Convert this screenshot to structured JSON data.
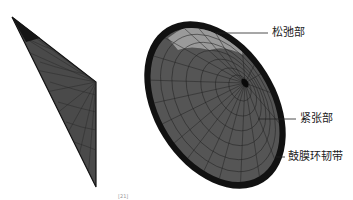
{
  "figure": {
    "left_view": {
      "description": "side view of tympanic membrane mesh"
    },
    "right_view": {
      "description": "oblique view of tympanic membrane mesh"
    },
    "labels": [
      {
        "id": "pars-flaccida",
        "text": "松弛部"
      },
      {
        "id": "pars-tensa",
        "text": "紧张部"
      },
      {
        "id": "annular-ligament",
        "text": "鼓膜环韧带"
      }
    ],
    "citation": "[21]"
  },
  "colors": {
    "mesh_dark": "#2a2a2a",
    "mesh_mid": "#555555",
    "mesh_light": "#9a9a9a",
    "ring": "#111111",
    "grid": "#1e1e1e",
    "leader": "#222222"
  }
}
